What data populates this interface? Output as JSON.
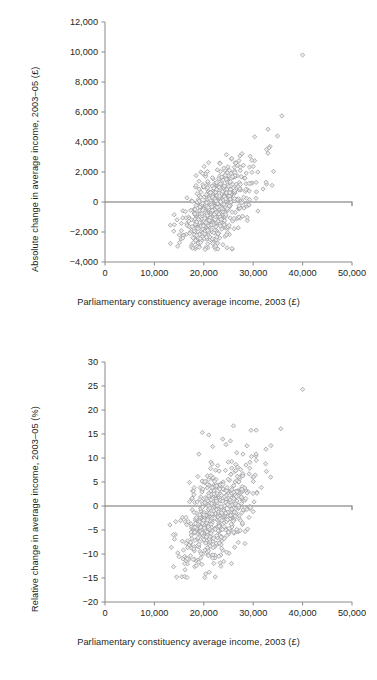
{
  "figure": {
    "background": "#ffffff",
    "marker_fill": "#ececed",
    "marker_stroke": "#9a9a9e",
    "axis_color": "#8a8a8a",
    "text_color": "#231f20"
  },
  "panels": [
    {
      "id": "absolute-change",
      "ylabel": "Absolute change in average income, 2003–05 (£)",
      "xlabel": "Parliamentary constituency average income, 2003 (£)",
      "yticks": [
        "-4,000",
        "-2,000",
        "0",
        "2,000",
        "4,000",
        "6,000",
        "8,000",
        "10,000",
        "12,000"
      ],
      "xticks": [
        "0",
        "10,000",
        "20,000",
        "30,000",
        "40,000",
        "50,000"
      ]
    },
    {
      "id": "relative-change",
      "ylabel": "Relative change in average income, 2003–05 (%)",
      "xlabel": "Parliamentary constituency average income, 2003 (£)",
      "yticks": [
        "-20",
        "-15",
        "-10",
        "-5",
        "0",
        "5",
        "10",
        "15",
        "20",
        "25",
        "30"
      ],
      "xticks": [
        "0",
        "10,000",
        "20,000",
        "30,000",
        "40,000",
        "50,000"
      ]
    }
  ],
  "chart_data": [
    {
      "type": "scatter",
      "title": "",
      "xlabel": "Parliamentary constituency average income, 2003 (£)",
      "ylabel": "Absolute change in average income, 2003–05 (£)",
      "xlim": [
        0,
        50000
      ],
      "ylim": [
        -4000,
        12000
      ],
      "xtick_values": [
        0,
        10000,
        20000,
        30000,
        40000,
        50000
      ],
      "ytick_values": [
        -4000,
        -2000,
        0,
        2000,
        4000,
        6000,
        8000,
        10000,
        12000
      ],
      "grid": false,
      "legend": null,
      "reference_lines": [
        {
          "axis": "y",
          "value": 0
        }
      ],
      "marker": "diamond",
      "n_points": 628,
      "notable_points": [
        {
          "x": 40000,
          "y": 9800,
          "note": "extreme outlier"
        },
        {
          "x": 35800,
          "y": 5750
        },
        {
          "x": 33000,
          "y": 4850
        },
        {
          "x": 34900,
          "y": 4400
        },
        {
          "x": 30300,
          "y": 4350
        },
        {
          "x": 33400,
          "y": 3700
        },
        {
          "x": 33200,
          "y": 3600
        },
        {
          "x": 32700,
          "y": 3500
        },
        {
          "x": 33000,
          "y": 3250
        },
        {
          "x": 29400,
          "y": 3050
        },
        {
          "x": 24700,
          "y": -3050
        },
        {
          "x": 25700,
          "y": -3100
        }
      ],
      "cluster": {
        "x_center": 21500,
        "y_center": -550,
        "x_spread": 3200,
        "y_spread": 1250,
        "x_range": [
          13000,
          36000
        ],
        "y_range": [
          -3200,
          5800
        ]
      },
      "trend": "positive association: higher 2003 income associated with larger absolute gain"
    },
    {
      "type": "scatter",
      "title": "",
      "xlabel": "Parliamentary constituency average income, 2003 (£)",
      "ylabel": "Relative change in average income, 2003–05 (%)",
      "xlim": [
        0,
        50000
      ],
      "ylim": [
        -20,
        30
      ],
      "xtick_values": [
        0,
        10000,
        20000,
        30000,
        40000,
        50000
      ],
      "ytick_values": [
        -20,
        -15,
        -10,
        -5,
        0,
        5,
        10,
        15,
        20,
        25,
        30
      ],
      "grid": false,
      "legend": null,
      "reference_lines": [
        {
          "axis": "y",
          "value": 0
        }
      ],
      "marker": "diamond",
      "n_points": 628,
      "notable_points": [
        {
          "x": 40000,
          "y": 24.3,
          "note": "extreme outlier"
        },
        {
          "x": 26000,
          "y": 16.7
        },
        {
          "x": 35600,
          "y": 16.1
        },
        {
          "x": 30600,
          "y": 15.8
        },
        {
          "x": 19700,
          "y": 15.3
        },
        {
          "x": 21000,
          "y": 14.8
        },
        {
          "x": 33600,
          "y": 12.6
        },
        {
          "x": 21800,
          "y": 12.4
        },
        {
          "x": 24500,
          "y": 12.8
        },
        {
          "x": 19000,
          "y": 10.8
        },
        {
          "x": 25600,
          "y": -12.0
        },
        {
          "x": 20200,
          "y": -14.9
        }
      ],
      "cluster": {
        "x_center": 21500,
        "y_center": -2.6,
        "x_spread": 3200,
        "y_spread": 5.2,
        "x_range": [
          13000,
          36000
        ],
        "y_range": [
          -15,
          17
        ]
      },
      "trend": "weak positive association between 2003 income and relative change"
    }
  ]
}
